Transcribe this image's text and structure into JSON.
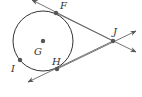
{
  "diagram": {
    "type": "geometry",
    "labels": {
      "F": "F",
      "G": "G",
      "H": "H",
      "I": "I",
      "J": "J"
    },
    "colors": {
      "stroke": "#333333",
      "line": "#555555",
      "point": "#555555"
    }
  }
}
